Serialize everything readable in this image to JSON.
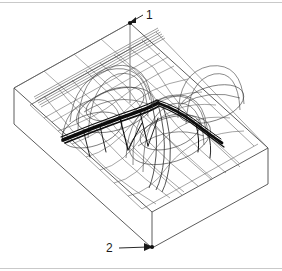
{
  "figure": {
    "type": "3d-wireframe-mesh",
    "background_color": "#ffffff",
    "mesh_color": "#555555",
    "block_edge_color": "#4a4a4a",
    "highlight_color": "#000000",
    "rule_color": "#c9c9c9"
  },
  "callouts": [
    {
      "id": "callout-1",
      "label": "1",
      "label_x": 146,
      "label_y": 12,
      "dot_x": 130,
      "dot_y": 23,
      "leader_from_x": 143,
      "leader_from_y": 15,
      "target": "top-vertical-axis-node"
    },
    {
      "id": "callout-2",
      "label": "2",
      "label_x": 108,
      "label_y": 243,
      "dot_x": 152,
      "dot_y": 247,
      "leader_from_x": 119,
      "leader_from_y": 248,
      "target": "front-bottom-corner-node"
    }
  ],
  "rules": [
    {
      "name": "top-rule",
      "y": 2
    },
    {
      "name": "bottom-rule",
      "y": 268
    }
  ],
  "block": {
    "top_back_left": {
      "x": 14,
      "y": 88
    },
    "top_back_right": {
      "x": 130,
      "y": 23
    },
    "top_front_right": {
      "x": 268,
      "y": 148
    },
    "top_front_left": {
      "x": 152,
      "y": 212
    },
    "depth": 36
  },
  "mesh": {
    "u_divisions": 10,
    "v_divisions": 8,
    "dome_count": 3,
    "ridge_band": true
  }
}
